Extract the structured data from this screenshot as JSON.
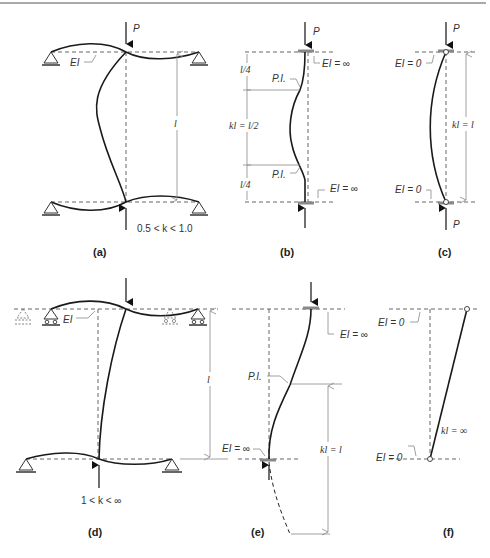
{
  "figure": {
    "top_rule": true,
    "panels": [
      {
        "id": "a",
        "caption": "(a)",
        "load_top": "P",
        "beam_label": "EI",
        "length_label": "l",
        "k_range": "0.5 < k < 1.0"
      },
      {
        "id": "b",
        "caption": "(b)",
        "load_top": "P",
        "top_stiffness": "EI = ∞",
        "bottom_stiffness": "EI = ∞",
        "segment_top": "l/4",
        "segment_mid": "kl = l/2",
        "segment_bottom": "l/4",
        "inflection_top": "P.I.",
        "inflection_bottom": "P.I."
      },
      {
        "id": "c",
        "caption": "(c)",
        "load_top": "P",
        "load_bottom": "P",
        "top_stiffness": "EI = 0",
        "bottom_stiffness": "EI = 0",
        "effective_length": "kl = l"
      },
      {
        "id": "d",
        "caption": "(d)",
        "beam_label": "EI",
        "length_label": "l",
        "k_range": "1 < k < ∞"
      },
      {
        "id": "e",
        "caption": "(e)",
        "top_stiffness": "EI = ∞",
        "bottom_stiffness": "EI = ∞",
        "inflection": "P.I.",
        "effective_length": "kl = l"
      },
      {
        "id": "f",
        "caption": "(f)",
        "top_stiffness": "EI = 0",
        "bottom_stiffness": "EI = 0",
        "effective_length": "kl = ∞"
      }
    ]
  }
}
